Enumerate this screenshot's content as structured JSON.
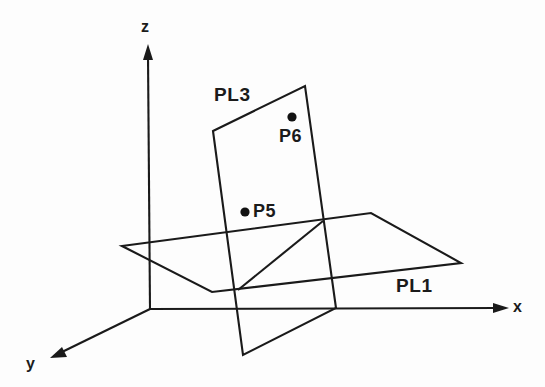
{
  "figure": {
    "background_color": "#fdfdfd",
    "line_color": "#1a1a1a",
    "axes": [
      {
        "id": "x",
        "label": "x",
        "direction": "right",
        "label_x": 513,
        "label_y": 299
      },
      {
        "id": "y",
        "label": "y",
        "direction": "lower-left",
        "label_x": 26,
        "label_y": 356
      },
      {
        "id": "z",
        "label": "z",
        "direction": "up",
        "label_x": 141,
        "label_y": 19
      }
    ],
    "planes": [
      {
        "id": "PL1",
        "label": "PL1",
        "orientation": "horizontal",
        "label_x": 396,
        "label_y": 276,
        "vertices": [
          [
            122,
            246
          ],
          [
            371,
            213
          ],
          [
            461,
            263
          ],
          [
            212,
            292
          ]
        ]
      },
      {
        "id": "PL3",
        "label": "PL3",
        "orientation": "vertical-tilted",
        "label_x": 214,
        "label_y": 85,
        "vertices": [
          [
            213,
            131
          ],
          [
            305,
            86
          ],
          [
            336,
            308
          ],
          [
            243,
            355
          ]
        ]
      }
    ],
    "points": [
      {
        "id": "P5",
        "label": "P5",
        "on_plane": "PL3",
        "dot_x": 245,
        "dot_y": 212,
        "label_x": 253,
        "label_y": 202
      },
      {
        "id": "P6",
        "label": "P6",
        "on_plane": "PL3",
        "dot_x": 292,
        "dot_y": 117,
        "label_x": 279,
        "label_y": 127
      }
    ],
    "intersection_line": {
      "id": "plane-intersection",
      "from": [
        238,
        290
      ],
      "to": [
        323,
        221
      ]
    }
  }
}
